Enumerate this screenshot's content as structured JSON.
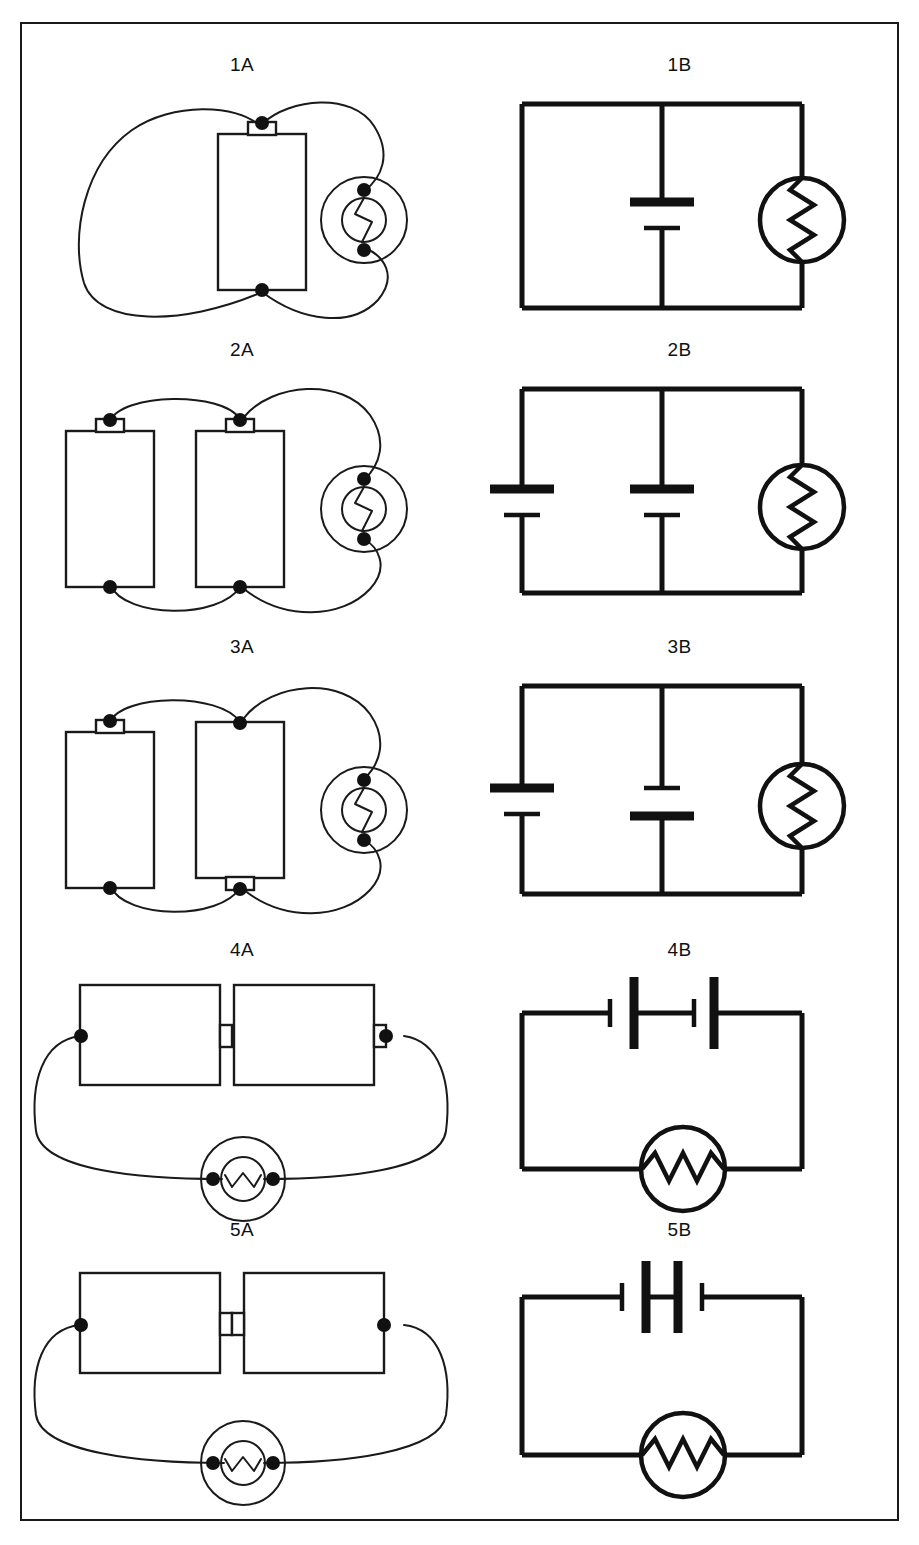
{
  "figure": {
    "width": 919,
    "height": 1545,
    "border_color": "#1a1a1a",
    "ink_color": "#111111",
    "background": "#ffffff"
  },
  "rows": [
    {
      "id": "row-1",
      "pictorial": {
        "caption": "1A",
        "style": "pictorial",
        "cells": [
          {
            "orientation": "vertical",
            "terminal": "top",
            "label": "single cell, positive nub up"
          }
        ],
        "lamp": {
          "type": "round-bulb",
          "filament": "vertical-zigzag",
          "position": "right"
        },
        "wires": "two curved leads from each cell terminal around to the bulb contacts"
      },
      "schematic": {
        "caption": "1B",
        "style": "schematic",
        "topology": "parallel",
        "batteries": [
          {
            "branch": "middle",
            "polarity": "positive-top",
            "plates": [
              "long",
              "short"
            ]
          }
        ],
        "lamp": {
          "type": "circle-zigzag",
          "filament": "vertical-zigzag",
          "branch": "right"
        }
      }
    },
    {
      "id": "row-2",
      "pictorial": {
        "caption": "2A",
        "style": "pictorial",
        "cells": [
          {
            "orientation": "vertical",
            "terminal": "top",
            "label": "left cell, positive nub up"
          },
          {
            "orientation": "vertical",
            "terminal": "top",
            "label": "right cell, positive nub up"
          }
        ],
        "lamp": {
          "type": "round-bulb",
          "filament": "vertical-zigzag",
          "position": "right"
        },
        "wires": "cells joined top-to-top and bottom-to-bottom, then out to the bulb"
      },
      "schematic": {
        "caption": "2B",
        "style": "schematic",
        "topology": "parallel",
        "batteries": [
          {
            "branch": "left",
            "polarity": "positive-top",
            "plates": [
              "long",
              "short"
            ]
          },
          {
            "branch": "middle",
            "polarity": "positive-top",
            "plates": [
              "long",
              "short"
            ]
          }
        ],
        "lamp": {
          "type": "circle-zigzag",
          "filament": "vertical-zigzag",
          "branch": "right"
        }
      }
    },
    {
      "id": "row-3",
      "pictorial": {
        "caption": "3A",
        "style": "pictorial",
        "cells": [
          {
            "orientation": "vertical",
            "terminal": "top",
            "label": "left cell, positive nub up"
          },
          {
            "orientation": "vertical",
            "terminal": "bottom",
            "label": "right cell, positive nub down"
          }
        ],
        "lamp": {
          "type": "round-bulb",
          "filament": "vertical-zigzag",
          "position": "right"
        },
        "wires": "cells joined top-to-top and bottom-to-bottom with opposite polarities, then out to the bulb"
      },
      "schematic": {
        "caption": "3B",
        "style": "schematic",
        "topology": "parallel",
        "batteries": [
          {
            "branch": "left",
            "polarity": "positive-top",
            "plates": [
              "long",
              "short"
            ]
          },
          {
            "branch": "middle",
            "polarity": "positive-bottom",
            "plates": [
              "short",
              "long"
            ]
          }
        ],
        "lamp": {
          "type": "circle-zigzag",
          "filament": "vertical-zigzag",
          "branch": "right"
        }
      }
    },
    {
      "id": "row-4",
      "pictorial": {
        "caption": "4A",
        "style": "pictorial",
        "cells": [
          {
            "orientation": "horizontal",
            "terminal": "right",
            "label": "left cell, positive nub right"
          },
          {
            "orientation": "horizontal",
            "terminal": "right",
            "label": "right cell, positive nub right"
          }
        ],
        "lamp": {
          "type": "round-bulb",
          "filament": "horizontal-zigzag",
          "position": "bottom"
        },
        "wires": "cells end-to-end in series, loop down to the bulb below"
      },
      "schematic": {
        "caption": "4B",
        "style": "schematic",
        "topology": "series",
        "batteries": [
          {
            "branch": "top",
            "polarity": "series-aiding",
            "plates": [
              "short",
              "long",
              "short",
              "long"
            ]
          }
        ],
        "lamp": {
          "type": "circle-zigzag",
          "filament": "horizontal-zigzag",
          "branch": "bottom"
        }
      }
    },
    {
      "id": "row-5",
      "pictorial": {
        "caption": "5A",
        "style": "pictorial",
        "cells": [
          {
            "orientation": "horizontal",
            "terminal": "right",
            "label": "left cell, positive nub right"
          },
          {
            "orientation": "horizontal",
            "terminal": "left",
            "label": "right cell, positive nub left"
          }
        ],
        "lamp": {
          "type": "round-bulb",
          "filament": "horizontal-zigzag",
          "position": "bottom"
        },
        "wires": "cells nub-to-nub in opposition, loop down to the bulb below"
      },
      "schematic": {
        "caption": "5B",
        "style": "schematic",
        "topology": "series-opposing",
        "batteries": [
          {
            "branch": "top",
            "polarity": "series-opposing",
            "plates": [
              "short",
              "long",
              "long",
              "short"
            ]
          }
        ],
        "lamp": {
          "type": "circle-zigzag",
          "filament": "horizontal-zigzag",
          "branch": "bottom"
        }
      }
    }
  ]
}
